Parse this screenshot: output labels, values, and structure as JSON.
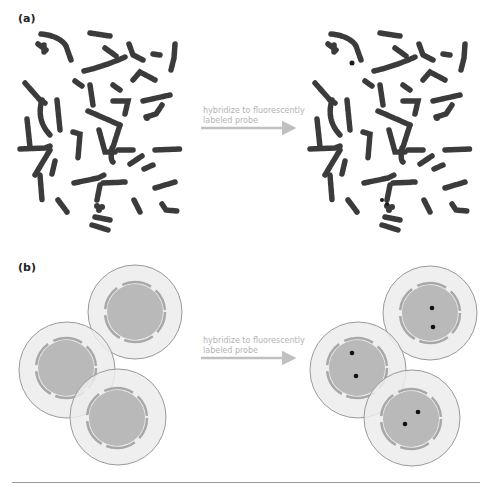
{
  "panels": {
    "a": {
      "label": "(a)",
      "arrow_text_line1": "hybridize to fluorescently",
      "arrow_text_line2": "labeled probe",
      "left_spread": "metaphase chromosome spread (unlabeled)",
      "right_spread": "metaphase chromosome spread (probe hybridized)"
    },
    "b": {
      "label": "(b)",
      "arrow_text_line1": "hybridize to fluorescently",
      "arrow_text_line2": "labeled probe",
      "cells_before": [
        {
          "cx": 135,
          "cy": 312
        },
        {
          "cx": 67,
          "cy": 370
        },
        {
          "cx": 118,
          "cy": 417
        }
      ],
      "cells_after": [
        {
          "cx": 430,
          "cy": 313,
          "dots": [
            [
              432,
              308
            ],
            [
              433,
              327
            ]
          ]
        },
        {
          "cx": 358,
          "cy": 370,
          "dots": [
            [
              352,
              353
            ],
            [
              356,
              376
            ]
          ]
        },
        {
          "cx": 412,
          "cy": 418,
          "dots": [
            [
              418,
              412
            ],
            [
              405,
              424
            ]
          ]
        }
      ]
    }
  },
  "colors": {
    "chromosome": "#3a3a3a",
    "chromosome_band": "#8a8a8a",
    "cytoplasm": "#ececec",
    "cell_outline": "#9a9a9a",
    "nucleus": "#b9b9b9",
    "arrow": "#c0c0c0",
    "probe_dot": "#111111"
  }
}
